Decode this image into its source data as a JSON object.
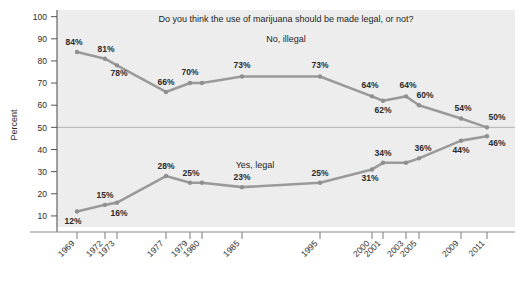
{
  "chart_data": {
    "type": "line",
    "title": "Do you think the use of marijuana should be made legal, or not?",
    "xlabel": "",
    "ylabel": "Percent",
    "ylim": [
      0,
      100
    ],
    "yticks": [
      10,
      20,
      30,
      40,
      50,
      60,
      70,
      80,
      90,
      100
    ],
    "grid": false,
    "legend_position": "inline-annotation",
    "reference_line": 50,
    "x": [
      1969,
      1972,
      1973,
      1977,
      1979,
      1980,
      1985,
      1995,
      2000,
      2001,
      2003,
      2005,
      2009,
      2011
    ],
    "categories": [
      "1969",
      "1972",
      "1973",
      "1977",
      "1979",
      "1980",
      "1985",
      "1995",
      "2000",
      "2001",
      "2003",
      "2005",
      "2009",
      "2011"
    ],
    "series": [
      {
        "name": "No, illegal",
        "values": [
          84,
          81,
          78,
          66,
          70,
          70,
          73,
          73,
          64,
          62,
          64,
          60,
          54,
          50
        ],
        "labels": [
          "84%",
          "81%",
          "78%",
          "66%",
          "70%",
          "",
          "73%",
          "73%",
          "64%",
          "62%",
          "64%",
          "60%",
          "54%",
          "50%"
        ],
        "color": "#9a9a9a"
      },
      {
        "name": "Yes, legal",
        "values": [
          12,
          15,
          16,
          28,
          25,
          25,
          23,
          25,
          31,
          34,
          34,
          36,
          44,
          46
        ],
        "labels": [
          "12%",
          "15%",
          "16%",
          "28%",
          "25%",
          "",
          "23%",
          "25%",
          "31%",
          "34%",
          "",
          "36%",
          "44%",
          "46%"
        ],
        "color": "#9a9a9a"
      }
    ]
  },
  "annotations": {
    "no_illegal_label": "No, illegal",
    "yes_legal_label": "Yes, legal"
  },
  "axis": {
    "y_title": "Percent",
    "y_ticks": [
      "100",
      "90",
      "80",
      "70",
      "60",
      "50",
      "40",
      "30",
      "20",
      "10"
    ],
    "x_ticks": [
      "1969",
      "1972",
      "1973",
      "1977",
      "1979",
      "1980",
      "1985",
      "1995",
      "2000",
      "2001",
      "2003",
      "2005",
      "2009",
      "2011"
    ]
  },
  "colors": {
    "plot_background": "#eeeeee",
    "line": "#9a9a9a",
    "marker": "#8f8f8f",
    "axis": "#4a4a4a",
    "reference_line": "#b0b0b0"
  }
}
